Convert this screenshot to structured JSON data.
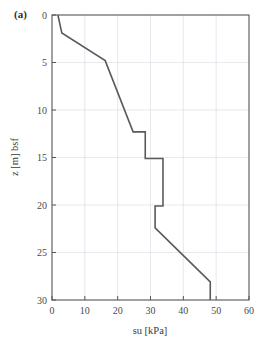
{
  "figure": {
    "panel_label": "(a)",
    "background_color": "#ffffff",
    "line_color": "#5a5a5a",
    "frame_color": "#555555",
    "grid_color": "#d8d8e2"
  },
  "chart_data": {
    "type": "line",
    "title": "",
    "xlabel": "su [kPa]",
    "ylabel": "z [m] bsf",
    "xlim": [
      0,
      60
    ],
    "ylim": [
      30,
      0
    ],
    "y_inverted": true,
    "grid": true,
    "legend": null,
    "xticks": [
      0,
      10,
      20,
      30,
      40,
      50,
      60
    ],
    "xtick_labels": [
      "0",
      "10",
      "20",
      "30",
      "40",
      "50",
      "60"
    ],
    "yticks": [
      0,
      5,
      10,
      15,
      20,
      25,
      30
    ],
    "ytick_labels": [
      "0",
      "5",
      "10",
      "15",
      "20",
      "25",
      "30"
    ],
    "series": [
      {
        "name": "su profile",
        "x": [
          1.8,
          3.0,
          16.2,
          24.7,
          28.4,
          28.4,
          33.8,
          33.8,
          31.4,
          31.4,
          48.2,
          48.2
        ],
        "y": [
          0.0,
          1.9,
          4.8,
          12.3,
          12.3,
          15.1,
          15.1,
          20.1,
          20.1,
          22.4,
          28.1,
          30.0
        ]
      }
    ]
  }
}
